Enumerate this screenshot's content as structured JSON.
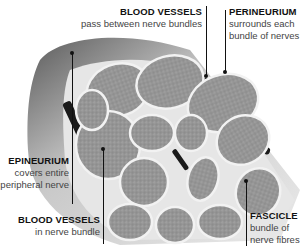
{
  "diagram": {
    "labels": [
      {
        "id": "blood-vessels-between",
        "title": "BLOOD VESSELS",
        "desc": [
          "pass between nerve bundles"
        ]
      },
      {
        "id": "perineurium",
        "title": "PERINEURIUM",
        "desc": [
          "surrounds each",
          "bundle of nerves"
        ]
      },
      {
        "id": "epineurium",
        "title": "EPINEURIUM",
        "desc": [
          "covers entire",
          "peripheral nerve"
        ]
      },
      {
        "id": "blood-vessels-in",
        "title": "BLOOD VESSELS",
        "desc": [
          "in nerve bundle"
        ]
      },
      {
        "id": "fascicle",
        "title": "FASCICLE",
        "desc": [
          "bundle of",
          "nerve fibres"
        ]
      }
    ],
    "colors": {
      "fascicle": "#9a9a9a",
      "sheath": "#e4e4e4",
      "epineurium": "#b0b0b0",
      "vessel": "#1a1a1a",
      "text": "#111111"
    }
  }
}
